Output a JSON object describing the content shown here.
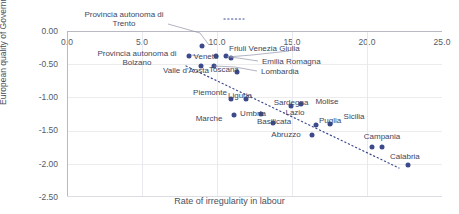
{
  "chart_data": {
    "type": "scatter",
    "title": "",
    "xlabel": "Rate of irregularity in labour",
    "ylabel": "European quality of Government index",
    "xlim": [
      0,
      25
    ],
    "ylim": [
      -2.5,
      0.0
    ],
    "xticks": [
      "0.0",
      "5.0",
      "10.0",
      "15.0",
      "20.0",
      "25.0"
    ],
    "yticks": [
      "0.00",
      "-0.50",
      "-1.00",
      "-1.50",
      "-2.00",
      "-2.50"
    ],
    "grid": true,
    "legend": "none",
    "xaxis_position": "top",
    "accent_color": "#3c4a8c",
    "trendline": {
      "style": "dotted",
      "color": "#3c4a8c"
    },
    "points": [
      {
        "label": "Provincia autonoma di Trento",
        "x": 9.0,
        "y": -0.23
      },
      {
        "label": "Provincia autonoma di Bolzano",
        "x": 8.1,
        "y": -0.38
      },
      {
        "label": "Veneto",
        "x": 9.9,
        "y": -0.37
      },
      {
        "label": "Friuli Venezia Giulia",
        "x": 10.6,
        "y": -0.38
      },
      {
        "label": "Emilia Romagna",
        "x": 10.9,
        "y": -0.4
      },
      {
        "label": "Valle d'Aosta",
        "x": 8.9,
        "y": -0.53
      },
      {
        "label": "Toscana",
        "x": 11.3,
        "y": -0.62
      },
      {
        "label": "Lombardia",
        "x": 9.8,
        "y": -0.53
      },
      {
        "label": "Piemonte",
        "x": 10.9,
        "y": -1.02
      },
      {
        "label": "Liguria",
        "x": 11.9,
        "y": -1.03
      },
      {
        "label": "Marche",
        "x": 11.1,
        "y": -1.27
      },
      {
        "label": "Umbria",
        "x": 12.9,
        "y": -1.25
      },
      {
        "label": "Basilicata",
        "x": 13.7,
        "y": -1.38
      },
      {
        "label": "Sardegna",
        "x": 14.9,
        "y": -1.13
      },
      {
        "label": "Molise",
        "x": 15.6,
        "y": -1.1
      },
      {
        "label": "Lazio",
        "x": 16.6,
        "y": -1.41
      },
      {
        "label": "Puglia",
        "x": 17.5,
        "y": -1.4
      },
      {
        "label": "Abruzzo",
        "x": 16.3,
        "y": -1.57
      },
      {
        "label": "Sicilia",
        "x": 20.3,
        "y": -1.74
      },
      {
        "label": "Campania",
        "x": 21.0,
        "y": -1.75
      },
      {
        "label": "Calabria",
        "x": 22.7,
        "y": -2.02
      }
    ]
  },
  "labels": {
    "trento": "Provincia autonoma di\nTrento",
    "bolzano": "Provincia autonoma di\nBolzano",
    "veneto": "Veneto",
    "friuli": "Friuli Venezia Giulia",
    "emilia": "Emilia Romagna",
    "lombardia": "Lombardia",
    "valle": "Valle d'Aosta",
    "toscana": "Toscana",
    "piemonte": "Piemonte",
    "liguria": "Liguria",
    "marche": "Marche",
    "umbria": "Umbria",
    "basilicata": "Basilicata",
    "sardegna": "Sardegna",
    "molise": "Molise",
    "lazio": "Lazio",
    "puglia": "Puglia",
    "abruzzo": "Abruzzo",
    "sicilia": "Sicilia",
    "campania": "Campania",
    "calabria": "Calabria"
  },
  "labels_line1": {
    "trento": "Provincia autonoma di",
    "trento2": "Trento",
    "bolzano": "Provincia autonoma di",
    "bolzano2": "Bolzano"
  }
}
